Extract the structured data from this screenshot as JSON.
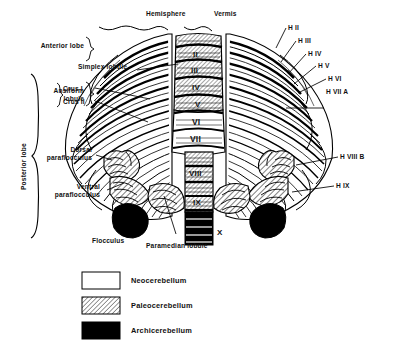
{
  "figure": {
    "background": "#ffffff",
    "ink": "#000000"
  },
  "headers": {
    "hemisphere": "Hemisphere",
    "vermis": "Vermis"
  },
  "left_labels": {
    "anterior_lobe": "Anterior lobe",
    "posterior_lobe": "Posterior lobe",
    "simplex_lobule": "Simplex lobule",
    "ansiform_lobule": "Ansiform lobule",
    "crus_i": "Crus I",
    "crus_ii": "Crus II",
    "dorsal_paraflocculus": "Dorsal paraflocculus",
    "ventral_paraflocculus": "Ventral paraflocculus",
    "flocculus": "Flocculus",
    "paramedian_lobule": "Paramedian lobule"
  },
  "right_labels": [
    {
      "id": "h2",
      "text": "H II"
    },
    {
      "id": "h3",
      "text": "H III"
    },
    {
      "id": "h4",
      "text": "H IV"
    },
    {
      "id": "h5",
      "text": "H V"
    },
    {
      "id": "h6",
      "text": "H VI"
    },
    {
      "id": "h7a",
      "text": "H VII A"
    },
    {
      "id": "h8b",
      "text": "H VIII B"
    },
    {
      "id": "h9",
      "text": "H IX"
    }
  ],
  "vermis_segments": [
    {
      "id": "v2",
      "text": "II",
      "fill": "paleocerebellum"
    },
    {
      "id": "v3",
      "text": "III",
      "fill": "paleocerebellum"
    },
    {
      "id": "v4",
      "text": "IV",
      "fill": "paleocerebellum"
    },
    {
      "id": "v5",
      "text": "V",
      "fill": "paleocerebellum"
    },
    {
      "id": "v6",
      "text": "VI",
      "fill": "neocerebellum"
    },
    {
      "id": "v7",
      "text": "VII",
      "fill": "neocerebellum"
    },
    {
      "id": "v8",
      "text": "VIII",
      "fill": "paleocerebellum"
    },
    {
      "id": "v9",
      "text": "IX",
      "fill": "paleocerebellum"
    },
    {
      "id": "v10",
      "text": "X",
      "fill": "archicerebellum"
    }
  ],
  "legend": {
    "items": [
      {
        "id": "neo",
        "label": "Neocerebellum",
        "swatch": "white",
        "color": "#ffffff"
      },
      {
        "id": "paleo",
        "label": "Paleocerebellum",
        "swatch": "hatched",
        "color": "#ffffff"
      },
      {
        "id": "archi",
        "label": "Archicerebellum",
        "swatch": "solid",
        "color": "#000000"
      }
    ]
  }
}
